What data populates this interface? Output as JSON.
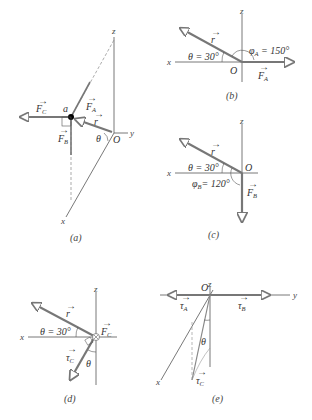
{
  "figure": {
    "panels": [
      {
        "id": "a",
        "caption": "(a)",
        "axes": {
          "x": "x",
          "y": "y",
          "z": "z"
        },
        "origin": "O",
        "point": "a",
        "vectors": {
          "FC": "F",
          "FC_sub": "C",
          "FA": "F",
          "FA_sub": "A",
          "FB": "F",
          "FB_sub": "B",
          "r": "r"
        },
        "angle": "θ"
      },
      {
        "id": "b",
        "caption": "(b)",
        "axes": {
          "x": "x",
          "z": "z"
        },
        "origin": "O",
        "theta_label": "θ = 30°",
        "phi_label": "φ",
        "phi_sub": "A",
        "phi_value": " = 150°",
        "vectors": {
          "r": "r",
          "F": "F",
          "F_sub": "A"
        }
      },
      {
        "id": "c",
        "caption": "(c)",
        "axes": {
          "x": "x",
          "z": "z"
        },
        "origin": "O",
        "theta_label": "θ = 30°",
        "phi_label": "φ",
        "phi_sub": "B",
        "phi_value": "= 120°",
        "vectors": {
          "r": "r",
          "F": "F",
          "F_sub": "B"
        }
      },
      {
        "id": "d",
        "caption": "(d)",
        "axes": {
          "x": "x",
          "z": "z"
        },
        "theta_label": "θ = 30°",
        "angle": "θ",
        "vectors": {
          "r": "r",
          "F": "F",
          "F_sub": "C",
          "tau": "τ",
          "tau_sub": "C"
        }
      },
      {
        "id": "e",
        "caption": "(e)",
        "axes": {
          "x": "x",
          "y": "y",
          "z": "z"
        },
        "origin": "O",
        "angle": "θ",
        "vectors": {
          "tauA": "τ",
          "tauA_sub": "A",
          "tauB": "τ",
          "tauB_sub": "B",
          "tauC": "τ",
          "tauC_sub": "C"
        }
      }
    ],
    "colors": {
      "vector": "#7a7a7a",
      "axis": "#555555",
      "background": "#ffffff"
    }
  }
}
